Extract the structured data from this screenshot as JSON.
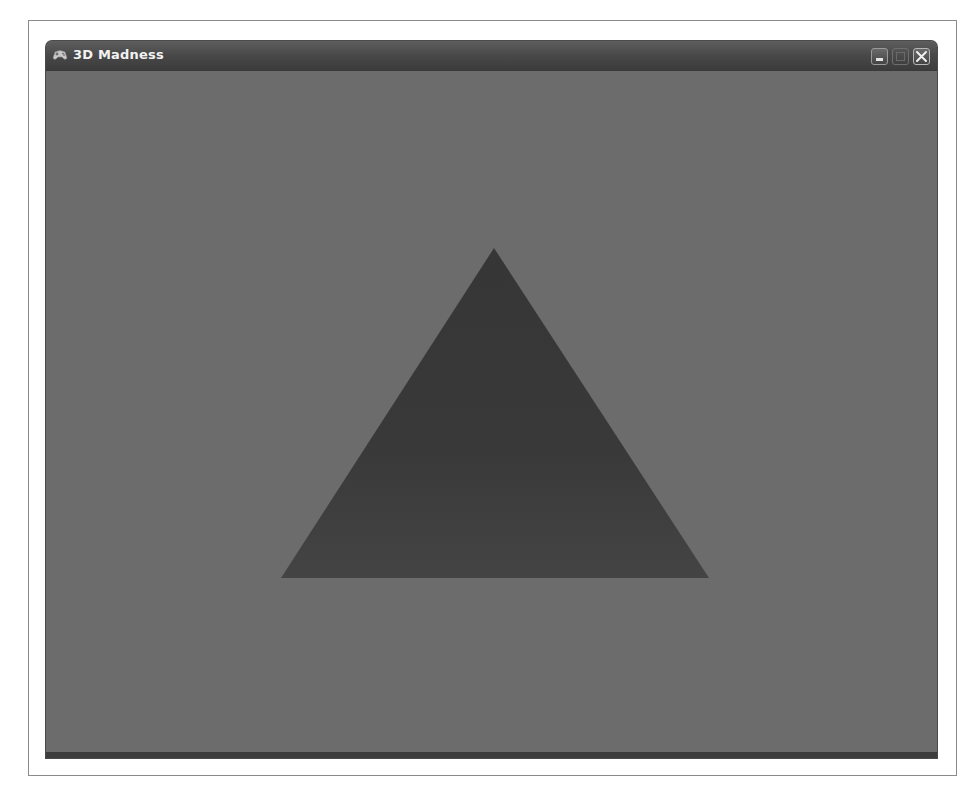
{
  "window": {
    "title": "3D Madness",
    "app_icon": "gamepad-icon",
    "controls": {
      "minimize": "minimize-icon",
      "maximize": "maximize-icon",
      "close": "close-icon"
    }
  },
  "scene": {
    "background_color": "#6c6c6c",
    "triangle": {
      "fill_color": "#3b3b3b",
      "vertices": [
        [
          494,
          248
        ],
        [
          281,
          578
        ],
        [
          709,
          578
        ]
      ]
    }
  }
}
